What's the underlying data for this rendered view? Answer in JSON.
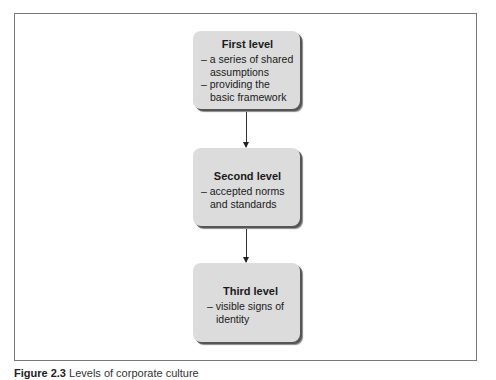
{
  "diagram": {
    "type": "flow-vertical",
    "levels": [
      {
        "title": "First level",
        "lines": [
          "– a series of shared assumptions",
          "– providing the basic framework"
        ]
      },
      {
        "title": "Second level",
        "lines": [
          "– accepted norms and standards"
        ]
      },
      {
        "title": "Third level",
        "lines": [
          "– visible signs of identity"
        ]
      }
    ],
    "edges": [
      {
        "from": "First level",
        "to": "Second level"
      },
      {
        "from": "Second level",
        "to": "Third level"
      }
    ]
  },
  "caption": {
    "label": "Figure 2.3",
    "text": "Levels of corporate culture"
  },
  "colors": {
    "box_fill": "#dcdcdc",
    "box_shadow": "#555555",
    "frame": "#777777",
    "arrow": "#333333"
  }
}
